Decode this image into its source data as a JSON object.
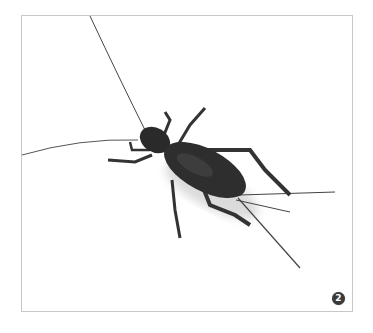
{
  "figure": {
    "badge_number": "2",
    "colors": {
      "frame_border": "#c8c8c8",
      "insect_body": "#2a2a2a",
      "badge_bg": "#3a3a3a"
    }
  }
}
